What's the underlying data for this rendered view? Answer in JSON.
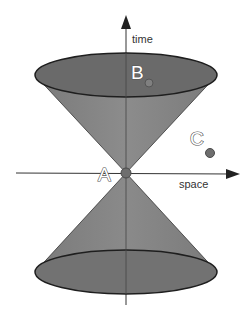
{
  "diagram": {
    "axes": {
      "time_label": "time",
      "space_label": "space"
    },
    "points": [
      {
        "id": "A",
        "label": "A",
        "region": "origin / apex"
      },
      {
        "id": "B",
        "label": "B",
        "region": "inside future light cone"
      },
      {
        "id": "C",
        "label": "C",
        "region": "outside light cone"
      }
    ],
    "colors": {
      "cone_side": "#808080",
      "cone_cap": "#6a6a6a",
      "cone_outline": "#222222",
      "axis": "#333333",
      "point": "#707070",
      "point_stroke": "#505050",
      "background": "#ffffff"
    }
  }
}
